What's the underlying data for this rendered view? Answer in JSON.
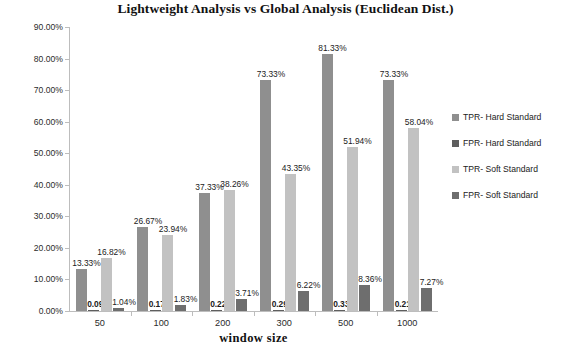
{
  "chart_data": {
    "type": "bar",
    "title": "Lightweight Analysis vs Global Analysis (Euclidean Dist.)",
    "xlabel": "window  size",
    "ylabel": "",
    "ylim": [
      0,
      90
    ],
    "ytick_labels": [
      "90.00%",
      "80.00%",
      "70.00%",
      "60.00%",
      "50.00%",
      "40.00%",
      "30.00%",
      "20.00%",
      "10.00%",
      "0.00%"
    ],
    "ytick_values": [
      90,
      80,
      70,
      60,
      50,
      40,
      30,
      20,
      10,
      0
    ],
    "grid": false,
    "legend_position": "right",
    "categories": [
      "50",
      "100",
      "200",
      "300",
      "500",
      "1000"
    ],
    "series": [
      {
        "name": "TPR- Hard Standard",
        "color": "#8f8f8f",
        "values": [
          13.33,
          26.67,
          37.33,
          73.33,
          81.33,
          73.33
        ],
        "labels": [
          "13.33%",
          "26.67%",
          "37.33%",
          "73.33%",
          "81.33%",
          "73.33%"
        ]
      },
      {
        "name": "FPR- Hard Standard",
        "color": "#5e5e5e",
        "values": [
          0.09,
          0.17,
          0.22,
          0.29,
          0.33,
          0.21
        ],
        "labels": [
          "0.09%",
          "0.17%",
          "0.22%",
          "0.29%",
          "0.33%",
          "0.21%"
        ]
      },
      {
        "name": "TPR- Soft Standard",
        "color": "#c2c2c2",
        "values": [
          16.82,
          23.94,
          38.26,
          43.35,
          51.94,
          58.04
        ],
        "labels": [
          "16.82%",
          "23.94%",
          "38.26%",
          "43.35%",
          "51.94%",
          "58.04%"
        ]
      },
      {
        "name": "FPR- Soft Standard",
        "color": "#6e6e6e",
        "values": [
          1.04,
          1.83,
          3.71,
          6.22,
          8.36,
          7.27
        ],
        "labels": [
          "1.04%",
          "1.83%",
          "3.71%",
          "6.22%",
          "8.36%",
          "7.27%"
        ]
      }
    ]
  }
}
